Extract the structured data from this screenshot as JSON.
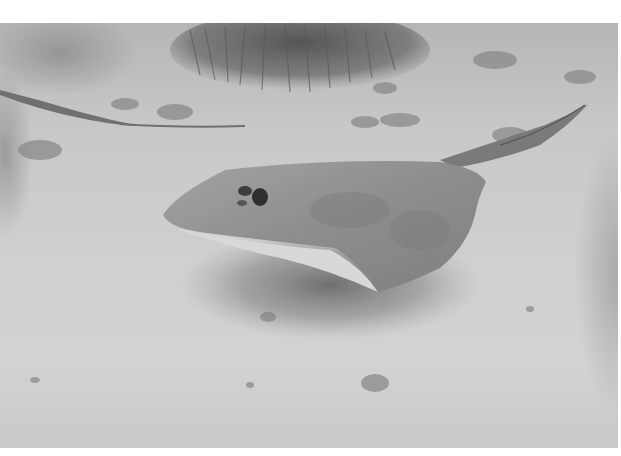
{
  "image": {
    "description": "Grayscale underwater photograph of a stingray resting on a sandy seabed, with a sea fan / coral clump in the background and a second ray's tail visible at left",
    "colors": {
      "background": "#ffffff",
      "sand": "#cfcfcf",
      "ray_body": "#8f8f8f",
      "ray_underside": "#d8d8d8",
      "shadow": "#7a7a7a",
      "coral": "#6e6e6e"
    }
  }
}
